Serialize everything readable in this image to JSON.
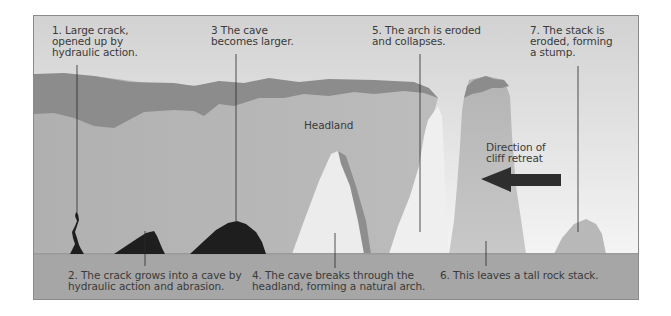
{
  "diagram": {
    "colors": {
      "sky_top": "#d4d4d4",
      "sky_bottom": "#f2f2f2",
      "cliff_top": "#8c8c8c",
      "headland": "#b4b4b4",
      "arch_shadow": "#8e8e8e",
      "cave": "#1e1e1e",
      "ground": "#a6a6a6",
      "arrow": "#2e2e2e",
      "frame": "#8a8a8a",
      "text": "#3a3a3a"
    },
    "labels": {
      "step1": "1. Large crack,\nopened up by\nhydraulic action.",
      "step2": "2. The crack grows into a cave by\nhydraulic action and abrasion.",
      "step3": "3 The cave\nbecomes larger.",
      "step4": "4. The cave breaks through the\nheadland, forming a natural arch.",
      "step5": "5. The arch is eroded\nand collapses.",
      "step6": "6. This leaves a tall rock stack.",
      "step7": "7. The stack is\neroded, forming\na stump.",
      "headland": "Headland",
      "direction": "Direction of\ncliff retreat"
    },
    "icons": {
      "arrow": "arrow-left-icon"
    }
  }
}
